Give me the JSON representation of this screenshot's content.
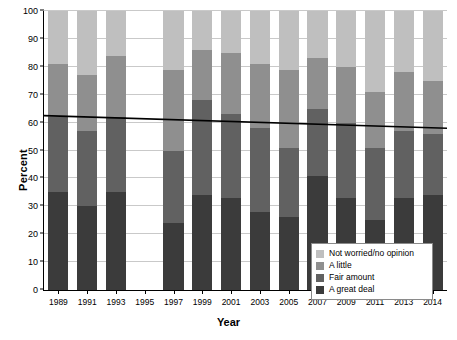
{
  "chart_data": {
    "type": "bar",
    "title": "",
    "subtitle": "",
    "xlabel": "Year",
    "ylabel": "Percent",
    "ylim": [
      0,
      100
    ],
    "yticks": [
      0,
      10,
      20,
      30,
      40,
      50,
      60,
      70,
      80,
      90,
      100
    ],
    "grid": true,
    "stacked": true,
    "legend_position": "bottom-right",
    "categories": [
      "1989",
      "1991",
      "1993",
      "1995",
      "1997",
      "1999",
      "2001",
      "2003",
      "2005",
      "2007",
      "2009",
      "2011",
      "2013",
      "2014"
    ],
    "series": [
      {
        "name": "A great deal",
        "color": "#3b3b3b",
        "values": [
          35,
          30,
          35,
          null,
          24,
          34,
          33,
          28,
          26,
          41,
          33,
          25,
          33,
          34
        ]
      },
      {
        "name": "Fair amount",
        "color": "#616161",
        "values": [
          27,
          27,
          27,
          null,
          26,
          34,
          30,
          30,
          25,
          24,
          27,
          26,
          24,
          22
        ]
      },
      {
        "name": "A little",
        "color": "#8f8f8f",
        "values": [
          19,
          20,
          22,
          null,
          29,
          18,
          22,
          23,
          28,
          18,
          20,
          20,
          21,
          19
        ]
      },
      {
        "name": "Not worried/no opinion",
        "color": "#bfbfbf",
        "values": [
          19,
          23,
          16,
          null,
          21,
          14,
          15,
          19,
          21,
          17,
          20,
          29,
          22,
          25
        ]
      }
    ],
    "cumulative_tops": {
      "a_great_deal": [
        35,
        30,
        35,
        null,
        24,
        34,
        33,
        28,
        26,
        41,
        33,
        25,
        33,
        34
      ],
      "fair_amount": [
        62,
        57,
        62,
        null,
        50,
        68,
        63,
        58,
        51,
        65,
        60,
        51,
        57,
        56
      ],
      "a_little": [
        81,
        77,
        84,
        null,
        79,
        86,
        85,
        81,
        79,
        83,
        80,
        71,
        78,
        75
      ],
      "not_worried": [
        100,
        100,
        100,
        null,
        100,
        100,
        100,
        100,
        100,
        100,
        100,
        100,
        100,
        100
      ]
    },
    "trend_line": {
      "name": "Trend",
      "color": "#000000",
      "start_value": 62.5,
      "end_value": 58.0
    },
    "annotations": []
  },
  "legend": {
    "items": [
      {
        "label": "Not worried/no opinion",
        "color": "#bfbfbf"
      },
      {
        "label": "A little",
        "color": "#8f8f8f"
      },
      {
        "label": "Fair amount",
        "color": "#616161"
      },
      {
        "label": "A great deal",
        "color": "#3b3b3b"
      }
    ]
  },
  "axes": {
    "y_title": "Percent",
    "x_title": "Year"
  },
  "colors": {
    "background": "#ffffff",
    "axis": "#000000",
    "grid": "#c9c9c9",
    "trend": "#000000"
  }
}
